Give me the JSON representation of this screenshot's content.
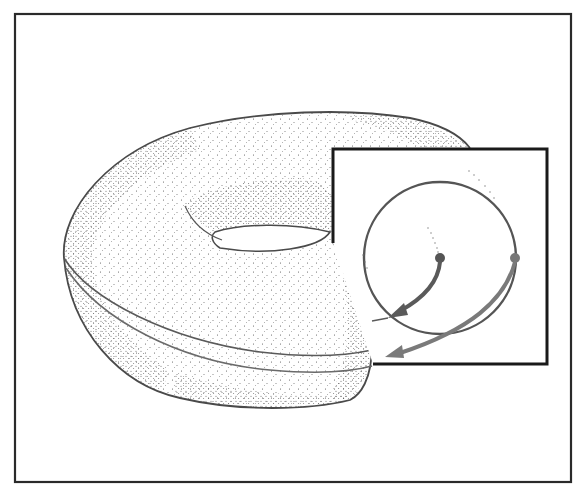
{
  "figure": {
    "text_labels": [],
    "colors": {
      "background": "#ffffff",
      "frame": "#2a2a2a",
      "outline": "#4a4a4a",
      "stipple": "#555555",
      "inset_border": "#1a1a1a",
      "circle": "#555555",
      "inner_arrow": "#5a5a5a",
      "outer_arrow": "#7a7a7a",
      "equator_line": "#6a6a6a"
    },
    "frame": {
      "x": 15,
      "y": 14,
      "width": 556,
      "height": 468
    },
    "inset_box": {
      "x": 333,
      "y": 149,
      "width": 214,
      "height": 215
    },
    "cross_section_circle": {
      "cx": 440,
      "cy": 258,
      "r": 76
    },
    "points": [
      {
        "name": "inner-point",
        "x": 440,
        "y": 258
      },
      {
        "name": "outer-point",
        "x": 515,
        "y": 258
      }
    ]
  }
}
